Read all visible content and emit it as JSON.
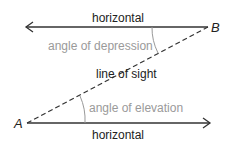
{
  "diagram": {
    "labels": {
      "top_horizontal": "horizontal",
      "bottom_horizontal": "horizontal",
      "line_of_sight": "line of sight",
      "angle_depression": "angle of depression",
      "angle_elevation": "angle of elevation",
      "point_a": "A",
      "point_b": "B"
    },
    "colors": {
      "line": "#333333",
      "angle_text": "#9a9a9a",
      "text": "#222222"
    }
  }
}
